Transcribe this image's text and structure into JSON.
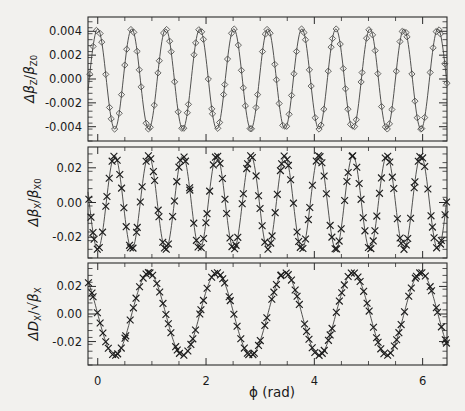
{
  "figure": {
    "background_color": "#f2f1ee",
    "foreground_color": "#1a1a1a",
    "curve_color": "#40403e"
  },
  "xaxis": {
    "label": "ϕ (rad)",
    "tick_labels": [
      "0",
      "2",
      "4",
      "6"
    ],
    "tick_values": [
      0,
      2,
      4,
      6
    ],
    "minor_step": 0.5,
    "range": [
      -0.18,
      6.45
    ]
  },
  "panels": [
    {
      "id": "top",
      "ylabel_parts": {
        "delta": "Δβ",
        "sub1": "Z",
        "slash": "/",
        "beta": "β",
        "sub2": "Z0"
      },
      "ylabel_plain": "Δβ_Z/β_Z0",
      "tick_labels": [
        "0.004",
        "0.002",
        "0.000",
        "-0.002",
        "-0.004"
      ],
      "tick_values": [
        0.004,
        0.002,
        0.0,
        -0.002,
        -0.004
      ],
      "ylim": [
        -0.0052,
        0.0052
      ],
      "marker": "diamond"
    },
    {
      "id": "middle",
      "ylabel_parts": {
        "delta": "Δβ",
        "sub1": "X",
        "slash": "/",
        "beta": "β",
        "sub2": "X0"
      },
      "ylabel_plain": "Δβ_X/β_X0",
      "tick_labels": [
        "0.02",
        "0.00",
        "-0.02"
      ],
      "tick_values": [
        0.02,
        0.0,
        -0.02
      ],
      "ylim": [
        -0.032,
        0.032
      ],
      "marker": "cross"
    },
    {
      "id": "bottom",
      "ylabel_parts": {
        "delta": "ΔD",
        "sub1": "X",
        "slash": "/√",
        "beta": "β",
        "sub2": "X"
      },
      "ylabel_plain": "ΔD_X/√β_X",
      "tick_labels": [
        "0.02",
        "0.00",
        "-0.02"
      ],
      "tick_values": [
        0.02,
        0.0,
        -0.02
      ],
      "ylim": [
        -0.037,
        0.037
      ],
      "marker": "cross"
    }
  ],
  "chart_data": {
    "type": "line",
    "title": "",
    "xlabel": "ϕ (rad)",
    "grid": false,
    "legend": null,
    "shared_x": {
      "label": "ϕ (rad)",
      "range": [
        -0.18,
        6.45
      ],
      "ticks": [
        0,
        2,
        4,
        6
      ]
    },
    "subplots": [
      {
        "name": "top",
        "ylabel": "Δβ_Z/β_Z0",
        "ylim": [
          -0.0052,
          0.0052
        ],
        "yticks": [
          -0.004,
          -0.002,
          0.0,
          0.002,
          0.004
        ],
        "marker": "diamond",
        "model": {
          "form": "A*cos(n*phi + p)",
          "amplitude": 0.0042,
          "cycles": 10,
          "phase_rad": 0.0,
          "note": "approximately 10 full oscillations across 0 to 2*pi, amplitude ~0.0042, starts near +max at phi=0"
        },
        "n_points": 120
      },
      {
        "name": "middle",
        "ylabel": "Δβ_X/β_X0",
        "ylim": [
          -0.032,
          0.032
        ],
        "yticks": [
          -0.02,
          0.0,
          0.02
        ],
        "marker": "cross",
        "model": {
          "form": "A*cos(n*phi + p)",
          "amplitude": 0.027,
          "cycles": 10,
          "phase_rad": 3.14159,
          "note": "approximately 10 full oscillations across 0 to 2*pi, amplitude ~0.027, starts near -max at phi=0"
        },
        "n_points": 150
      },
      {
        "name": "bottom",
        "ylabel": "ΔD_X/√β_X",
        "ylim": [
          -0.037,
          0.037
        ],
        "yticks": [
          -0.02,
          0.0,
          0.02
        ],
        "marker": "cross",
        "model": {
          "form": "A*cos(n*phi + p)",
          "amplitude": 0.03,
          "cycles": 5,
          "phase_rad": 1.5708,
          "note": "approximately 5 full oscillations across 0 to 2*pi, amplitude ~0.030, crosses zero going negative at phi=0"
        },
        "n_points": 120
      }
    ]
  }
}
